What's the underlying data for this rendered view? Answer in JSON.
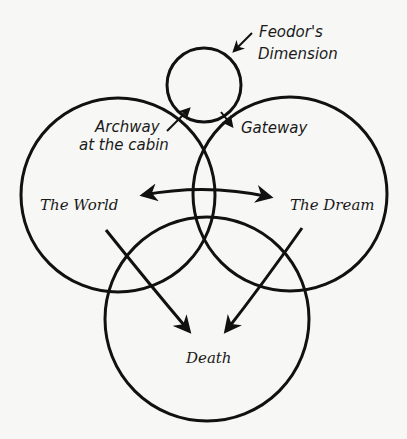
{
  "diagram": {
    "colors": {
      "background": "#f7f7f5",
      "ink": "#111111"
    },
    "circles": [
      {
        "name": "feodors-dimension",
        "cx": 204,
        "cy": 85,
        "r": 37
      },
      {
        "name": "the-world",
        "cx": 118,
        "cy": 195,
        "r": 97
      },
      {
        "name": "the-dream",
        "cx": 290,
        "cy": 194,
        "r": 97
      },
      {
        "name": "death",
        "cx": 207,
        "cy": 319,
        "r": 102
      }
    ],
    "labels": {
      "feodor_line1": "Feodor's",
      "feodor_line2": "Dimension",
      "archway_line1": "Archway",
      "archway_line2": "at the cabin",
      "gateway": "Gateway",
      "world": "The World",
      "dream": "The Dream",
      "death": "Death"
    },
    "arrows": [
      {
        "name": "feodor-pointer",
        "from": [
          252,
          33
        ],
        "to": [
          233,
          52
        ]
      },
      {
        "name": "archway-arrow",
        "from": [
          167,
          131
        ],
        "to": [
          190,
          108
        ]
      },
      {
        "name": "gateway-arrow",
        "from": [
          221,
          112
        ],
        "to": [
          233,
          127
        ]
      },
      {
        "name": "world-dream-double-arrow",
        "from": [
          141,
          195
        ],
        "to": [
          272,
          197
        ]
      },
      {
        "name": "world-to-death-arrow",
        "from": [
          106,
          230
        ],
        "to": [
          190,
          332
        ]
      },
      {
        "name": "dream-to-death-arrow",
        "from": [
          302,
          228
        ],
        "to": [
          225,
          332
        ]
      }
    ]
  }
}
